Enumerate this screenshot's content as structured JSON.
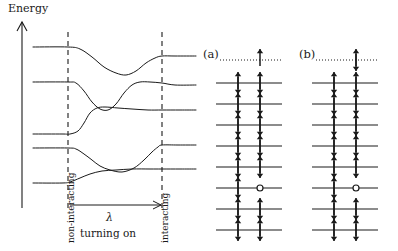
{
  "figure": {
    "background_color": "#ffffff",
    "ink_color": "#1a1a1a",
    "width": 398,
    "height": 251
  },
  "left_panel": {
    "name": "adiabatic-level-connection-diagram",
    "axis_label": "Energy",
    "axis": {
      "x": 22,
      "y_top": 22,
      "y_bottom": 208,
      "arrow": "up"
    },
    "vertical_dashed_lines": [
      {
        "label": "non-interacting",
        "x": 68
      },
      {
        "label": "interacting",
        "x": 162
      }
    ],
    "turning_on_arrow": {
      "label_lambda": "λ",
      "label_text": "turning on",
      "x_start": 70,
      "x_end": 161,
      "y": 205
    }
  },
  "right_panels": [
    {
      "id": "a",
      "label": "(a)",
      "fermi_line_style": "dotted",
      "fermi_particle": {
        "column": "right",
        "spin": "up"
      },
      "levels": [
        {
          "left": "updown",
          "right": "updown"
        },
        {
          "left": "updown",
          "right": "updown"
        },
        {
          "left": "updown",
          "right": "updown"
        },
        {
          "left": "updown",
          "right": "updown"
        },
        {
          "left": "updown",
          "right": "updown"
        },
        {
          "left": "updown",
          "right": "hole"
        },
        {
          "left": "updown",
          "right": "updown"
        },
        {
          "left": "updown",
          "right": "updown"
        }
      ]
    },
    {
      "id": "b",
      "label": "(b)",
      "fermi_line_style": "dotted",
      "fermi_particle": {
        "column": "right",
        "spin": "updown"
      },
      "levels": [
        {
          "left": "updown",
          "right": "updown"
        },
        {
          "left": "updown",
          "right": "updown"
        },
        {
          "left": "updown",
          "right": "updown"
        },
        {
          "left": "updown",
          "right": "updown"
        },
        {
          "left": "updown",
          "right": "updown"
        },
        {
          "left": "updown",
          "right": "hole"
        },
        {
          "left": "updown",
          "right": "updown"
        },
        {
          "left": "updown",
          "right": "updown"
        }
      ]
    }
  ],
  "chart_data": {
    "type": "line",
    "title": "",
    "xlabel": "turning on",
    "ylabel": "Energy",
    "grid": false,
    "legend": "none",
    "annotations": [
      "Energy",
      "non-interacting",
      "interacting",
      "λ",
      "turning on",
      "(a)",
      "(b)"
    ],
    "series": [
      {
        "name": "level-1",
        "comment": "topmost: flat, dips down, rises back to a higher flat plateau",
        "points": [
          [
            33,
            47
          ],
          [
            68,
            47
          ],
          [
            80,
            49
          ],
          [
            92,
            57
          ],
          [
            104,
            67
          ],
          [
            116,
            73
          ],
          [
            126,
            75
          ],
          [
            136,
            71
          ],
          [
            146,
            63
          ],
          [
            155,
            58
          ],
          [
            162,
            56
          ],
          [
            175,
            56
          ],
          [
            196,
            56
          ]
        ]
      },
      {
        "name": "level-2",
        "comment": "second: flat, dips down sharply, bumps up over a hump, settles",
        "points": [
          [
            33,
            82
          ],
          [
            68,
            82
          ],
          [
            76,
            83
          ],
          [
            84,
            91
          ],
          [
            92,
            102
          ],
          [
            100,
            109
          ],
          [
            108,
            110
          ],
          [
            116,
            104
          ],
          [
            124,
            93
          ],
          [
            132,
            85
          ],
          [
            140,
            82
          ],
          [
            150,
            82
          ],
          [
            162,
            83
          ],
          [
            175,
            85
          ],
          [
            196,
            85
          ]
        ]
      },
      {
        "name": "level-3",
        "comment": "third: rises steeply from low flat to high flat plateau",
        "points": [
          [
            33,
            134
          ],
          [
            62,
            134
          ],
          [
            70,
            134
          ],
          [
            78,
            131
          ],
          [
            84,
            123
          ],
          [
            90,
            113
          ],
          [
            97,
            108
          ],
          [
            105,
            107
          ],
          [
            118,
            108
          ],
          [
            132,
            109
          ],
          [
            148,
            110
          ],
          [
            162,
            110
          ],
          [
            180,
            110
          ],
          [
            196,
            110
          ]
        ]
      },
      {
        "name": "level-4",
        "comment": "fourth: flat, small dip, then rises to upper plateau",
        "points": [
          [
            33,
            148
          ],
          [
            68,
            148
          ],
          [
            76,
            149
          ],
          [
            84,
            154
          ],
          [
            92,
            160
          ],
          [
            100,
            166
          ],
          [
            110,
            170
          ],
          [
            122,
            172
          ],
          [
            134,
            168
          ],
          [
            144,
            160
          ],
          [
            152,
            152
          ],
          [
            158,
            147
          ],
          [
            162,
            145
          ],
          [
            178,
            145
          ],
          [
            196,
            145
          ]
        ]
      },
      {
        "name": "level-5",
        "comment": "bottom: flat low, rises to middle plateau crossing level-4 region",
        "points": [
          [
            33,
            183
          ],
          [
            62,
            183
          ],
          [
            70,
            182
          ],
          [
            80,
            178
          ],
          [
            90,
            174
          ],
          [
            102,
            171
          ],
          [
            116,
            170
          ],
          [
            132,
            169
          ],
          [
            150,
            169
          ],
          [
            162,
            169
          ],
          [
            180,
            169
          ],
          [
            196,
            169
          ]
        ]
      }
    ]
  }
}
